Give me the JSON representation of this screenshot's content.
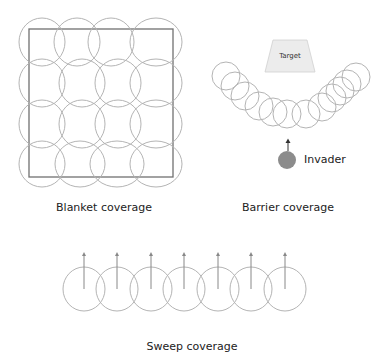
{
  "panels": {
    "blanket": {
      "caption": "Blanket coverage",
      "square": {
        "x": 29,
        "y": 29,
        "w": 144,
        "h": 148
      },
      "circles": [
        {
          "cx": 42,
          "cy": 42,
          "rx": 23,
          "ry": 24
        },
        {
          "cx": 77,
          "cy": 42,
          "rx": 23,
          "ry": 24
        },
        {
          "cx": 111,
          "cy": 42,
          "rx": 23,
          "ry": 24
        },
        {
          "cx": 156,
          "cy": 42,
          "rx": 26,
          "ry": 24
        },
        {
          "cx": 42,
          "cy": 83,
          "rx": 23,
          "ry": 24
        },
        {
          "cx": 82,
          "cy": 83,
          "rx": 23,
          "ry": 24
        },
        {
          "cx": 118,
          "cy": 83,
          "rx": 23,
          "ry": 24
        },
        {
          "cx": 156,
          "cy": 83,
          "rx": 26,
          "ry": 24
        },
        {
          "cx": 42,
          "cy": 124,
          "rx": 23,
          "ry": 24
        },
        {
          "cx": 82,
          "cy": 124,
          "rx": 23,
          "ry": 24
        },
        {
          "cx": 118,
          "cy": 124,
          "rx": 23,
          "ry": 24
        },
        {
          "cx": 156,
          "cy": 124,
          "rx": 26,
          "ry": 24
        },
        {
          "cx": 42,
          "cy": 164,
          "rx": 23,
          "ry": 23
        },
        {
          "cx": 80,
          "cy": 164,
          "rx": 25,
          "ry": 23
        },
        {
          "cx": 117,
          "cy": 164,
          "rx": 27,
          "ry": 23
        },
        {
          "cx": 156,
          "cy": 164,
          "rx": 26,
          "ry": 23
        }
      ]
    },
    "barrier": {
      "caption": "Barrier coverage",
      "target_label": "Target",
      "invader_label": "Invader",
      "circle_r": 14,
      "circles": [
        {
          "cx": 226,
          "cy": 76
        },
        {
          "cx": 235,
          "cy": 86
        },
        {
          "cx": 245,
          "cy": 96
        },
        {
          "cx": 259,
          "cy": 106
        },
        {
          "cx": 273,
          "cy": 112
        },
        {
          "cx": 287,
          "cy": 114
        },
        {
          "cx": 306,
          "cy": 114
        },
        {
          "cx": 322,
          "cy": 107
        },
        {
          "cx": 332,
          "cy": 98
        },
        {
          "cx": 340,
          "cy": 91
        },
        {
          "cx": 347,
          "cy": 84
        },
        {
          "cx": 356,
          "cy": 77
        }
      ]
    },
    "sweep": {
      "caption": "Sweep coverage",
      "circle_rx": 21,
      "circle_ry": 22,
      "cy": 289,
      "arrow_top": 252,
      "centers": [
        84,
        117,
        151,
        184,
        218,
        251,
        285
      ]
    }
  },
  "colors": {
    "circle_stroke": "#b4b4b4",
    "square_stroke": "#707070",
    "target_fill": "#ececec",
    "invader_fill": "#8c8c8c",
    "arrow": "#888888"
  }
}
